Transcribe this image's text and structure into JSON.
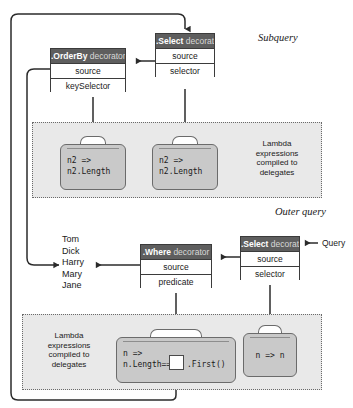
{
  "diagram": {
    "colors": {
      "header_fill": "#5e5e5e",
      "header_text": "#ffffff",
      "box_fill": "#ffffff",
      "box_border": "#3b3b3b",
      "panel_fill": "#e9e9e9",
      "panel_border": "#6a6a6a",
      "briefcase_fill": "#c9c9c9",
      "briefcase_border": "#6b6b6b",
      "wire": "#2b2b2b"
    }
  },
  "section_labels": {
    "subquery": "Subquery",
    "outer_query": "Outer query"
  },
  "entry_label": "Query",
  "decorators": {
    "subquery_select": {
      "method": ".Select",
      "suffix": " decorator",
      "rows": [
        "source",
        "selector"
      ]
    },
    "subquery_orderby": {
      "method": ".OrderBy",
      "suffix": " decorator",
      "rows": [
        "source",
        "keySelector"
      ]
    },
    "outer_select": {
      "method": ".Select",
      "suffix": " decorator",
      "rows": [
        "source",
        "selector"
      ]
    },
    "outer_where": {
      "method": ".Where",
      "suffix": " decorator",
      "rows": [
        "source",
        "predicate"
      ]
    }
  },
  "panels": {
    "subquery_panel": {
      "caption": "Lambda\nexpressions\ncompiled to\ndelegates",
      "caption_lines": [
        "Lambda",
        "expressions",
        "compiled to",
        "delegates"
      ]
    },
    "outer_panel": {
      "caption_lines": [
        "Lambda",
        "expressions",
        "compiled to",
        "delegates"
      ]
    }
  },
  "lambdas": {
    "orderby_keyselector": {
      "line1": "n2 =>",
      "line2": "n2.Length"
    },
    "subselect_selector": {
      "line1": "n2 =>",
      "line2": "n2.Length"
    },
    "where_predicate": {
      "line1": "n =>",
      "line2_prefix": "n.Length==",
      "line2_suffix": ".First()"
    },
    "outerselect_selector": {
      "text": "n => n"
    }
  },
  "names_list": {
    "items": [
      "Tom",
      "Dick",
      "Harry",
      "Mary",
      "Jane"
    ],
    "highlighted": "Harry"
  }
}
